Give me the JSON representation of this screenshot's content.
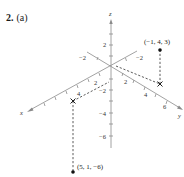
{
  "problem": {
    "number": "2.",
    "part": "(a)"
  },
  "axes": {
    "x_label": "x",
    "y_label": "y",
    "z_label": "z",
    "x_ticks": [
      "2",
      "4"
    ],
    "x_neg_tick": "−2",
    "y_ticks": [
      "2",
      "4",
      "6"
    ],
    "y_neg_tick": "−2",
    "z_ticks": [
      "2"
    ],
    "z_neg_ticks": [
      "−2",
      "−4",
      "−6"
    ]
  },
  "points": [
    {
      "label": "(−1, 4, 3)",
      "coords": [
        -1,
        4,
        3
      ]
    },
    {
      "label": "(5, 1, −6)",
      "coords": [
        5,
        1,
        -6
      ]
    }
  ],
  "colors": {
    "axis": "#8a8a8a",
    "dash": "#333333",
    "point": "#111111"
  }
}
